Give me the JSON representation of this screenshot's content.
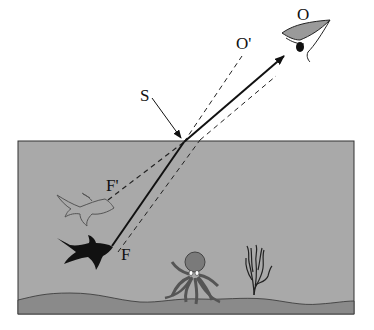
{
  "diagram": {
    "type": "refraction-illustration",
    "labels": {
      "observer": "O",
      "apparent_observer": "O'",
      "surface_point": "S",
      "apparent_fish": "F'",
      "fish": "F"
    },
    "colors": {
      "water": "#a9a9a9",
      "seabed": "#8a8a8a",
      "line": "#111111",
      "background": "#ffffff"
    }
  }
}
